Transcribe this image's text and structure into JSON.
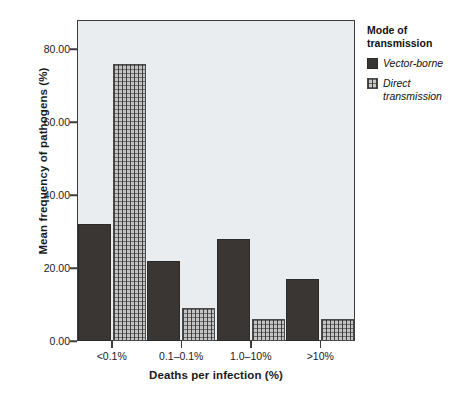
{
  "chart_data": {
    "type": "bar",
    "title": "",
    "xlabel": "Deaths per infection (%)",
    "ylabel": "Mean frequency of pathogens (%)",
    "categories": [
      "<0.1%",
      "0.1–0.1%",
      "1.0–10%",
      ">10%"
    ],
    "series": [
      {
        "name": "Vector-borne",
        "values": [
          32,
          22,
          28,
          17
        ]
      },
      {
        "name": "Direct transmission",
        "values": [
          76,
          9,
          6,
          6
        ]
      }
    ],
    "ylim": [
      0,
      88
    ],
    "yticks": [
      0,
      20,
      40,
      60,
      80
    ],
    "ytick_labels": [
      "0.00",
      "20.00",
      "40.00",
      "60.00",
      "80.00"
    ],
    "grid": false,
    "legend_position": "right",
    "legend_title": "Mode of transmission",
    "colors": {
      "vector_borne": "#3a3633",
      "direct_transmission": "#c3c3c3",
      "plot_background": "#e9edef",
      "axis": "#3d3d3d",
      "text": "#1a1a1a"
    }
  },
  "legend": {
    "title_line1": "Mode of",
    "title_line2": "transmission",
    "items": [
      {
        "label": "Vector-borne",
        "swatch": "vector-borne-swatch"
      },
      {
        "label": "Direct transmission",
        "swatch": "direct-transmission-swatch"
      }
    ]
  }
}
